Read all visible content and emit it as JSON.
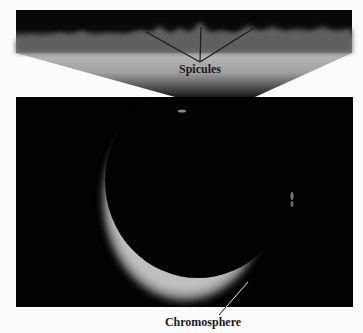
{
  "figure": {
    "type": "annotated-solar-eclipse-photograph",
    "labels": {
      "spicules": "Spicules",
      "chromosphere": "Chromosphere"
    },
    "colors": {
      "background": "#fbfbfb",
      "sky": "#020202",
      "chromosphere_glow": "#c8c8c8",
      "annotation_line": "#1a1a1a"
    }
  }
}
